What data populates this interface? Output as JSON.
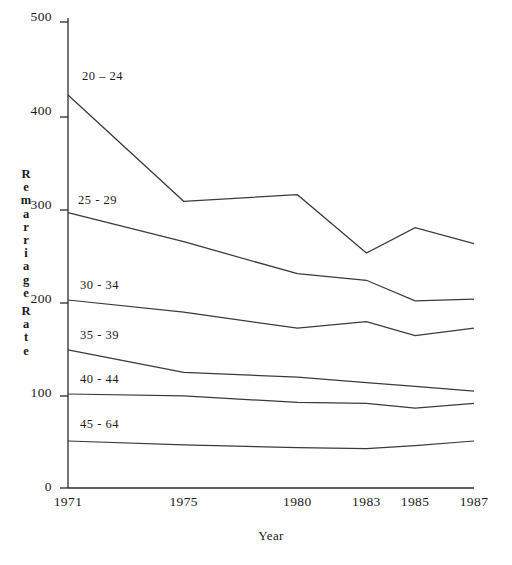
{
  "chart_data": {
    "type": "line",
    "title": "",
    "subtitle": "",
    "xlabel": "Year",
    "ylabel": "Remarriage Rate",
    "categories": [
      "1971",
      "1975",
      "1980",
      "1983",
      "1985",
      "1987"
    ],
    "x": [
      1971,
      1975,
      1980,
      1983,
      1985,
      1987
    ],
    "ylim": [
      0,
      500
    ],
    "yticks": [
      0,
      100,
      200,
      300,
      400,
      500
    ],
    "ytick_labels": [
      "0",
      "100",
      "200",
      "300",
      "400",
      "500"
    ],
    "grid": false,
    "legend": "inline-labels",
    "legend_position": "inline-left",
    "series": [
      {
        "name": "20 – 24",
        "values": [
          418,
          305,
          312,
          250,
          277,
          260
        ]
      },
      {
        "name": "25 - 29",
        "values": [
          293,
          262,
          228,
          221,
          199,
          201
        ]
      },
      {
        "name": "30 - 34",
        "values": [
          200,
          187,
          170,
          177,
          162,
          170
        ]
      },
      {
        "name": "35 - 39",
        "values": [
          147,
          123,
          118,
          112,
          108,
          103
        ]
      },
      {
        "name": "40 - 44",
        "values": [
          100,
          98,
          91,
          90,
          85,
          90
        ]
      },
      {
        "name": "45 - 64",
        "values": [
          50,
          46,
          43,
          42,
          45,
          50
        ]
      }
    ]
  },
  "axis": {
    "y_title_chars": [
      "R",
      "e",
      "m",
      "a",
      "r",
      "r",
      "i",
      "a",
      "g",
      "e"
    ],
    "y_title_chars2": [
      "R",
      "a",
      "t",
      "e"
    ],
    "x_title": "Year"
  },
  "colors": {
    "line": "#3a3a3a",
    "axis": "#2b2b2b",
    "text": "#1a1a1a",
    "background": "#ffffff"
  }
}
